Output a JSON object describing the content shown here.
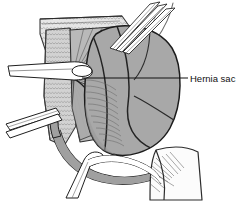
{
  "figure": {
    "type": "medical-line-illustration",
    "background_color": "#ffffff",
    "width": 248,
    "height": 202
  },
  "annotations": [
    {
      "id": "hernia-sac",
      "label": "Hernia sac",
      "leader_line": {
        "from_x": 82,
        "from_y": 78,
        "to_x": 188,
        "to_y": 78
      },
      "text_x": 190,
      "text_y": 81.5,
      "color": "#111111"
    }
  ],
  "palette": {
    "ink": "#1a1a1a",
    "outline": "#2b2b2b",
    "sac_fill": "#a8a8a8",
    "sac_shadow": "#909090",
    "muscle_fill": "#b5b5b5",
    "fascia_fill": "#cfcfcf",
    "stipple_fill": "#e2e2e2",
    "cord_fill": "#9e9e9e",
    "instrument_fill": "#ffffff",
    "flap_fill": "#fbfbfb",
    "hatch": "#6d6d6d"
  },
  "structures": [
    {
      "id": "skin-fascia-flap",
      "name": "Skin and fascia flap",
      "fill": "#e2e2e2",
      "texture": "scale-stipple"
    },
    {
      "id": "external-oblique",
      "name": "External oblique aponeurosis",
      "fill": "#b5b5b5",
      "texture": "radiating-fibers"
    },
    {
      "id": "lateral-fascia-band",
      "name": "Lateral fascial band",
      "fill": "#cfcfcf",
      "texture": "scale-stipple"
    },
    {
      "id": "hernia-sac-mass",
      "name": "Hernia sac",
      "fill": "#a8a8a8",
      "texture": "contour-lines"
    },
    {
      "id": "spermatic-cord",
      "name": "Spermatic cord",
      "fill": "#9e9e9e",
      "texture": "smooth"
    },
    {
      "id": "tissue-flap-lower-right",
      "name": "Retracted tissue flap",
      "fill": "#fbfbfb",
      "texture": "hatch"
    }
  ],
  "instruments": [
    {
      "id": "forceps-upper-left",
      "name": "Upper left forceps",
      "fill": "#ffffff"
    },
    {
      "id": "forceps-lower-left",
      "name": "Lower left forceps",
      "fill": "#ffffff"
    },
    {
      "id": "retractor-upper-right",
      "name": "Upper right retractor tines",
      "fill": "#ffffff"
    },
    {
      "id": "clamp-lower-center",
      "name": "Lower center clamp",
      "fill": "#ffffff"
    }
  ]
}
